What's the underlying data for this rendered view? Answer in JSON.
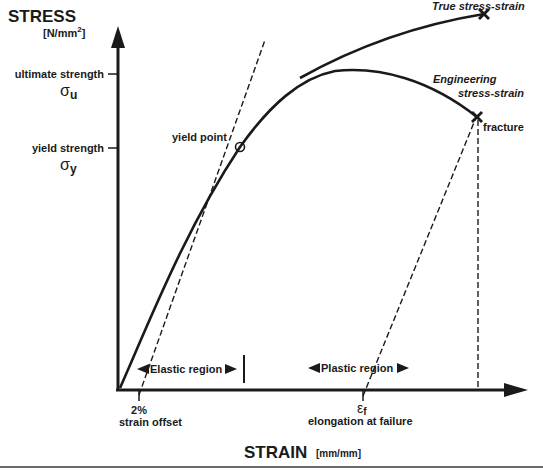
{
  "y_axis": {
    "title": "STRESS",
    "unit_prefix": "[N/mm",
    "unit_sup": "2",
    "unit_suffix": "]",
    "ticks": [
      {
        "label": "ultimate strength",
        "symbol": "σ",
        "subscript": "u"
      },
      {
        "label": "yield strength",
        "symbol": "σ",
        "subscript": "y"
      }
    ]
  },
  "x_axis": {
    "title": "STRAIN",
    "unit": "[mm/mm]",
    "ticks": [
      {
        "line1": "2%",
        "line2": "strain offset"
      },
      {
        "symbol": "ε",
        "subscript": "f",
        "line2": "elongation at failure"
      }
    ]
  },
  "annotations": {
    "yield_point": "yield point",
    "fracture": "fracture",
    "true_curve": "True stress-strain",
    "engineering_line1": "Engineering",
    "engineering_line2": "stress-strain",
    "elastic_region": "Elastic region",
    "plastic_region": "Plastic region"
  },
  "colors": {
    "ink": "#1a1a1a",
    "background": "#ffffff",
    "rule": "#6a6a6a"
  }
}
